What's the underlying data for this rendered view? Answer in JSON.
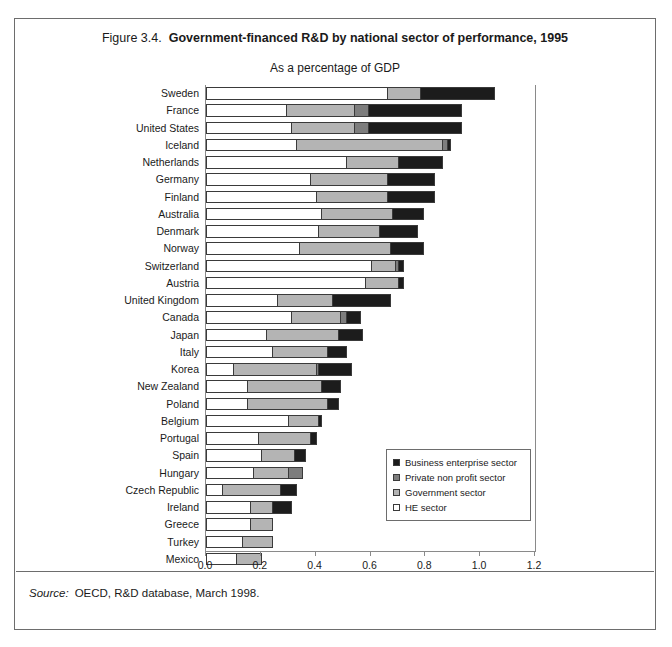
{
  "figure": {
    "number": "Figure 3.4.",
    "title": "Government-financed R&D by national sector of performance, 1995",
    "subtitle": "As a percentage of GDP",
    "source_label": "Source:",
    "source_text": "OECD, R&D database, March 1998."
  },
  "legend": {
    "items": [
      {
        "label": "Business enterprise sector",
        "key": "business",
        "color": "#1c1c1c",
        "swatch_name": "legend-swatch-business"
      },
      {
        "label": "Private non profit sector",
        "key": "private_non_profit",
        "color": "#7d7d7d",
        "swatch_name": "legend-swatch-private-non-profit"
      },
      {
        "label": "Government sector",
        "key": "government",
        "color": "#b4b4b4",
        "swatch_name": "legend-swatch-government"
      },
      {
        "label": "HE sector",
        "key": "he",
        "color": "#ffffff",
        "swatch_name": "legend-swatch-he"
      }
    ]
  },
  "chart_data": {
    "type": "bar",
    "orientation": "horizontal",
    "stacked": true,
    "title": "Government-financed R&D by national sector of performance, 1995",
    "subtitle": "As a percentage of GDP",
    "xlabel": "",
    "ylabel": "",
    "xlim": [
      0.0,
      1.2
    ],
    "xticks": [
      "0.0",
      "0.2",
      "0.4",
      "0.6",
      "0.8",
      "1.0",
      "1.2"
    ],
    "xtick_values": [
      0.0,
      0.2,
      0.4,
      0.6,
      0.8,
      1.0,
      1.2
    ],
    "grid": false,
    "legend_position": "inside-right-lower",
    "categories": [
      "Sweden",
      "France",
      "United States",
      "Iceland",
      "Netherlands",
      "Germany",
      "Finland",
      "Australia",
      "Denmark",
      "Norway",
      "Switzerland",
      "Austria",
      "United Kingdom",
      "Canada",
      "Japan",
      "Italy",
      "Korea",
      "New Zealand",
      "Poland",
      "Belgium",
      "Portugal",
      "Spain",
      "Hungary",
      "Czech Republic",
      "Ireland",
      "Greece",
      "Turkey",
      "Mexico"
    ],
    "series": [
      {
        "name": "HE sector",
        "color": "#ffffff",
        "values": [
          0.66,
          0.29,
          0.31,
          0.33,
          0.51,
          0.38,
          0.4,
          0.42,
          0.41,
          0.34,
          0.6,
          0.58,
          0.26,
          0.31,
          0.22,
          0.24,
          0.1,
          0.15,
          0.15,
          0.3,
          0.19,
          0.2,
          0.17,
          0.06,
          0.16,
          0.16,
          0.13,
          0.11
        ]
      },
      {
        "name": "Government sector",
        "color": "#b4b4b4",
        "values": [
          0.12,
          0.25,
          0.23,
          0.53,
          0.19,
          0.28,
          0.26,
          0.26,
          0.22,
          0.33,
          0.09,
          0.12,
          0.2,
          0.18,
          0.26,
          0.2,
          0.3,
          0.27,
          0.29,
          0.11,
          0.19,
          0.12,
          0.13,
          0.21,
          0.08,
          0.08,
          0.11,
          0.09
        ]
      },
      {
        "name": "Private non profit sector",
        "color": "#7d7d7d",
        "values": [
          0.0,
          0.05,
          0.05,
          0.02,
          0.0,
          0.0,
          0.0,
          0.0,
          0.0,
          0.0,
          0.01,
          0.0,
          0.0,
          0.02,
          0.0,
          0.0,
          0.01,
          0.0,
          0.0,
          0.0,
          0.0,
          0.0,
          0.05,
          0.0,
          0.0,
          0.0,
          0.0,
          0.0
        ]
      },
      {
        "name": "Business enterprise sector",
        "color": "#1c1c1c",
        "values": [
          0.27,
          0.34,
          0.34,
          0.01,
          0.16,
          0.17,
          0.17,
          0.11,
          0.14,
          0.12,
          0.02,
          0.02,
          0.21,
          0.05,
          0.09,
          0.07,
          0.12,
          0.07,
          0.04,
          0.01,
          0.02,
          0.04,
          0.0,
          0.06,
          0.07,
          0.0,
          0.0,
          0.0
        ]
      }
    ],
    "totals": [
      1.05,
      0.93,
      0.93,
      0.89,
      0.86,
      0.83,
      0.83,
      0.79,
      0.77,
      0.79,
      0.72,
      0.72,
      0.67,
      0.56,
      0.57,
      0.51,
      0.53,
      0.49,
      0.48,
      0.42,
      0.4,
      0.36,
      0.35,
      0.33,
      0.31,
      0.24,
      0.24,
      0.2
    ]
  }
}
